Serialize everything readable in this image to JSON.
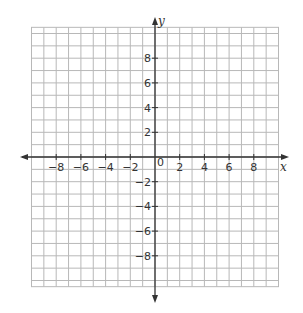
{
  "chart_data": {
    "type": "scatter",
    "title": "",
    "xlabel": "x",
    "ylabel": "y",
    "xlim": [
      -10,
      10
    ],
    "ylim": [
      -10.5,
      10.5
    ],
    "grid": true,
    "grid_step": 1,
    "x_ticks": [
      -8,
      -6,
      -4,
      -2,
      2,
      4,
      6,
      8
    ],
    "x_tick_labels": [
      "−8",
      "−6",
      "−4",
      "−2",
      "2",
      "4",
      "6",
      "8"
    ],
    "y_ticks": [
      8,
      6,
      4,
      2,
      -2,
      -4,
      -6,
      -8
    ],
    "y_tick_labels": [
      "8",
      "6",
      "4",
      "2",
      "−2",
      "−4",
      "−6",
      "−8"
    ],
    "origin_label": "0",
    "series": []
  },
  "colors": {
    "grid": "#b8b8b8",
    "axis": "#333333",
    "background": "#ffffff"
  }
}
